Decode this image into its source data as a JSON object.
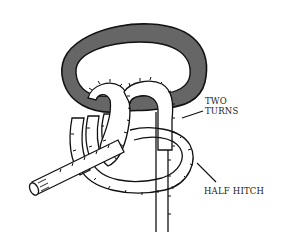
{
  "diagram": {
    "colors": {
      "ring_fill": "#666666",
      "ink": "#111111",
      "rope_fill": "#ffffff",
      "background": "#ffffff"
    },
    "labels": {
      "two_turns_line1": "TWO",
      "two_turns_line2": "TURNS",
      "half_hitch": "HALF HITCH"
    }
  }
}
